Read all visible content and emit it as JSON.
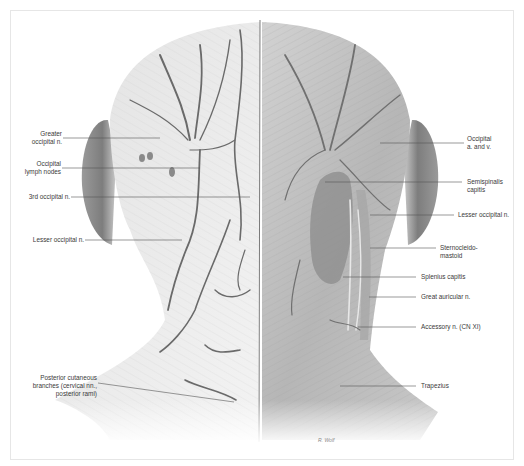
{
  "figure": {
    "view": "posterior",
    "signature": "R. Wolf"
  },
  "labels_left": [
    {
      "id": "greater-occipital-n",
      "text": "Greater\noccipital n.",
      "x": 30,
      "y": 134,
      "line": [
        63,
        138,
        160,
        138
      ]
    },
    {
      "id": "occipital-lymph-nodes",
      "text": "Occipital\nlymph nodes",
      "x": 18,
      "y": 164,
      "line": [
        62,
        168,
        200,
        168
      ]
    },
    {
      "id": "3rd-occipital-n",
      "text": "3rd occipital n.",
      "x": 24,
      "y": 194,
      "line": [
        71,
        197,
        250,
        197
      ]
    },
    {
      "id": "lesser-occipital-n-left",
      "text": "Lesser occipital n.",
      "x": 31,
      "y": 237,
      "line": [
        85,
        240,
        182,
        240
      ]
    },
    {
      "id": "posterior-cutaneous-branches",
      "text": "Posterior cutaneous\nbranches (cervical nn.,\nposterior rami)",
      "x": 28,
      "y": 379,
      "line": [
        98,
        383,
        234,
        402
      ]
    }
  ],
  "labels_right": [
    {
      "id": "occipital-a-and-v",
      "text": "Occipital\na. and v.",
      "x": 470,
      "y": 134,
      "line": [
        380,
        143,
        464,
        143
      ]
    },
    {
      "id": "semispinalis-capitis",
      "text": "Semispinalis\ncapitis",
      "x": 468,
      "y": 178,
      "line": [
        325,
        182,
        462,
        182
      ]
    },
    {
      "id": "lesser-occipital-n-right",
      "text": "Lesser occipital n.",
      "x": 459,
      "y": 211,
      "line": [
        370,
        215,
        454,
        215
      ]
    },
    {
      "id": "sternocleidomastoid",
      "text": "Sternocleido-\nmastoid",
      "x": 441,
      "y": 243,
      "line": [
        370,
        248,
        436,
        248
      ]
    },
    {
      "id": "splenius-capitis",
      "text": "Splenius capitis",
      "x": 421,
      "y": 273,
      "line": [
        343,
        277,
        416,
        277
      ]
    },
    {
      "id": "great-auricular-n",
      "text": "Great auricular n.",
      "x": 421,
      "y": 293,
      "line": [
        369,
        297,
        416,
        297
      ]
    },
    {
      "id": "accessory-n",
      "text": "Accessory n. (CN XI)",
      "x": 421,
      "y": 323,
      "line": [
        358,
        327,
        416,
        327
      ]
    },
    {
      "id": "trapezius",
      "text": "Trapezius",
      "x": 421,
      "y": 382,
      "line": [
        340,
        386,
        416,
        386
      ]
    }
  ],
  "colors": {
    "background": "#ffffff",
    "label_text": "#3a3a3a",
    "leader_line": "#555555",
    "skin_light": "#eeeeee",
    "muscle_mid": "#bdbdbd",
    "ear_shade": "#8c8c8c",
    "vessel": "#6a6a6a"
  }
}
